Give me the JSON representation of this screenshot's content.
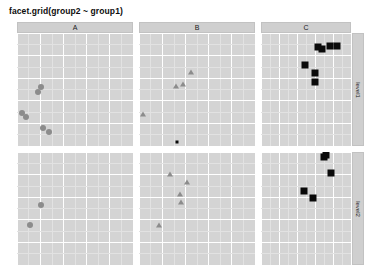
{
  "title": "facet.grid(group2 ~ group1)",
  "chart_data": {
    "type": "scatter",
    "title": "facet.grid(group2 ~ group1)",
    "xlabel": "",
    "ylabel": "",
    "xlim": [
      0,
      10
    ],
    "ylim": [
      0,
      10
    ],
    "grid": true,
    "legend": "none",
    "facet_formula": "group2 ~ group1",
    "col_var": "group1",
    "row_var": "group2",
    "col_levels": [
      "A",
      "B",
      "C"
    ],
    "row_levels": [
      "level1",
      "level2"
    ],
    "series": [
      {
        "name": "A",
        "marker": "circle",
        "color": "#8c8c8c",
        "facet_col": "A",
        "facet_row": "level1",
        "x": [
          2.05,
          1.85,
          0.45,
          0.75,
          2.25,
          2.75
        ],
        "y": [
          5.25,
          4.75,
          2.95,
          2.55,
          1.55,
          1.25
        ]
      },
      {
        "name": "B",
        "marker": "triangle",
        "color": "#8c8c8c",
        "facet_col": "B",
        "facet_row": "level1",
        "x": [
          4.45,
          3.15,
          3.75,
          0.35
        ],
        "y": [
          6.55,
          5.35,
          5.45,
          2.85
        ]
      },
      {
        "name": "C",
        "marker": "square",
        "color": "#0a0a0a",
        "facet_col": "C",
        "facet_row": "level1",
        "x": [
          6.35,
          6.75,
          7.65,
          8.45,
          4.85,
          5.95,
          5.95
        ],
        "y": [
          8.75,
          8.55,
          8.85,
          8.85,
          7.15,
          6.45,
          5.65
        ]
      },
      {
        "name": "B-outlier",
        "marker": "square",
        "color": "#0a0a0a",
        "facet_col": "B",
        "facet_row": "level1",
        "x": [
          3.25
        ],
        "y": [
          0.35
        ]
      },
      {
        "name": "A",
        "marker": "circle",
        "color": "#8c8c8c",
        "facet_col": "A",
        "facet_row": "level2",
        "x": [
          2.05,
          1.15
        ],
        "y": [
          5.35,
          3.55
        ]
      },
      {
        "name": "B",
        "marker": "triangle",
        "color": "#8c8c8c",
        "facet_col": "B",
        "facet_row": "level2",
        "x": [
          2.65,
          4.15,
          3.55,
          3.65,
          1.75
        ],
        "y": [
          8.05,
          7.35,
          6.25,
          5.55,
          3.55
        ]
      },
      {
        "name": "C",
        "marker": "square",
        "color": "#0a0a0a",
        "facet_col": "C",
        "facet_row": "level2",
        "x": [
          6.95,
          7.25,
          7.75,
          4.75,
          5.75
        ],
        "y": [
          9.55,
          9.75,
          8.15,
          6.55,
          5.95
        ]
      }
    ]
  },
  "facets": {
    "columns": [
      {
        "id": "col-a",
        "label": "A"
      },
      {
        "id": "col-b",
        "label": "B"
      },
      {
        "id": "col-c",
        "label": "C"
      }
    ],
    "rows": [
      {
        "id": "row-level1",
        "label": "level1"
      },
      {
        "id": "row-level2",
        "label": "level2"
      }
    ]
  },
  "colors": {
    "panel_background": "#d4d4d4",
    "strip_background": "#cfcfcf",
    "gridline_major": "#ffffff",
    "gridline_minor": "#e2e2e2",
    "circle_marker": "#8c8c8c",
    "triangle_marker": "#8c8c8c",
    "square_marker": "#0a0a0a",
    "page_background": "#ffffff",
    "title_text": "#0d0d0d"
  }
}
